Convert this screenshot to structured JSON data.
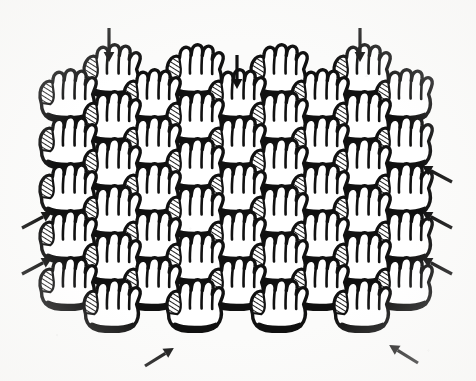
{
  "figure": {
    "title": "Tessellated hand pattern with directional arrows",
    "description": "A field of repeating mitten-like hand (glove) outlines arranged in a staggered offset grid, surrounded by solid black arrows pointing inward toward the pattern.",
    "background_color": "#fbfbfa",
    "ink_color": "#111111",
    "canvas": {
      "width": 476,
      "height": 381
    }
  },
  "motif": {
    "name": "hand-glove-outline",
    "fingers": 4,
    "has_hatched_thumb_panel": true,
    "has_thick_cuff": true,
    "nominal_width": 62,
    "nominal_height": 60,
    "outline_stroke": 3.4,
    "cuff_stroke": 5.0
  },
  "grid": {
    "type": "staggered-offset",
    "column_spacing": 83.5,
    "row_spacing": 47,
    "stagger_offset_x": 42,
    "main_column_x": [
      68,
      152,
      237,
      320,
      404
    ],
    "offset_column_x": [
      112,
      195,
      279,
      362
    ],
    "main_row_y": [
      98,
      145,
      192,
      239,
      286
    ],
    "offset_row_y": [
      73,
      120,
      167,
      214,
      261,
      308
    ],
    "hand_count": 50
  },
  "hands": [
    {
      "id": "hand-r0-c0",
      "x": 112,
      "y": 73,
      "row": 0,
      "col": 0
    },
    {
      "id": "hand-r0-c1",
      "x": 195,
      "y": 73,
      "row": 0,
      "col": 1
    },
    {
      "id": "hand-r0-c2",
      "x": 279,
      "y": 73,
      "row": 0,
      "col": 2
    },
    {
      "id": "hand-r0-c3",
      "x": 362,
      "y": 73,
      "row": 0,
      "col": 3
    },
    {
      "id": "hand-r1-c0",
      "x": 68,
      "y": 98,
      "row": 1,
      "col": 0
    },
    {
      "id": "hand-r1-c1",
      "x": 152,
      "y": 98,
      "row": 1,
      "col": 1
    },
    {
      "id": "hand-r1-c2",
      "x": 237,
      "y": 98,
      "row": 1,
      "col": 2
    },
    {
      "id": "hand-r1-c3",
      "x": 320,
      "y": 98,
      "row": 1,
      "col": 3
    },
    {
      "id": "hand-r1-c4",
      "x": 404,
      "y": 98,
      "row": 1,
      "col": 4
    },
    {
      "id": "hand-r2-c0",
      "x": 112,
      "y": 120,
      "row": 2,
      "col": 0
    },
    {
      "id": "hand-r2-c1",
      "x": 195,
      "y": 120,
      "row": 2,
      "col": 1
    },
    {
      "id": "hand-r2-c2",
      "x": 279,
      "y": 120,
      "row": 2,
      "col": 2
    },
    {
      "id": "hand-r2-c3",
      "x": 362,
      "y": 120,
      "row": 2,
      "col": 3
    },
    {
      "id": "hand-r3-c0",
      "x": 68,
      "y": 145,
      "row": 3,
      "col": 0
    },
    {
      "id": "hand-r3-c1",
      "x": 152,
      "y": 145,
      "row": 3,
      "col": 1
    },
    {
      "id": "hand-r3-c2",
      "x": 237,
      "y": 145,
      "row": 3,
      "col": 2
    },
    {
      "id": "hand-r3-c3",
      "x": 320,
      "y": 145,
      "row": 3,
      "col": 3
    },
    {
      "id": "hand-r3-c4",
      "x": 404,
      "y": 145,
      "row": 3,
      "col": 4
    },
    {
      "id": "hand-r4-c0",
      "x": 112,
      "y": 167,
      "row": 4,
      "col": 0
    },
    {
      "id": "hand-r4-c1",
      "x": 195,
      "y": 167,
      "row": 4,
      "col": 1
    },
    {
      "id": "hand-r4-c2",
      "x": 279,
      "y": 167,
      "row": 4,
      "col": 2
    },
    {
      "id": "hand-r4-c3",
      "x": 362,
      "y": 167,
      "row": 4,
      "col": 3
    },
    {
      "id": "hand-r5-c0",
      "x": 68,
      "y": 192,
      "row": 5,
      "col": 0
    },
    {
      "id": "hand-r5-c1",
      "x": 152,
      "y": 192,
      "row": 5,
      "col": 1
    },
    {
      "id": "hand-r5-c2",
      "x": 237,
      "y": 192,
      "row": 5,
      "col": 2
    },
    {
      "id": "hand-r5-c3",
      "x": 320,
      "y": 192,
      "row": 5,
      "col": 3
    },
    {
      "id": "hand-r5-c4",
      "x": 404,
      "y": 192,
      "row": 5,
      "col": 4
    },
    {
      "id": "hand-r6-c0",
      "x": 112,
      "y": 214,
      "row": 6,
      "col": 0
    },
    {
      "id": "hand-r6-c1",
      "x": 195,
      "y": 214,
      "row": 6,
      "col": 1
    },
    {
      "id": "hand-r6-c2",
      "x": 279,
      "y": 214,
      "row": 6,
      "col": 2
    },
    {
      "id": "hand-r6-c3",
      "x": 362,
      "y": 214,
      "row": 6,
      "col": 3
    },
    {
      "id": "hand-r7-c0",
      "x": 68,
      "y": 239,
      "row": 7,
      "col": 0
    },
    {
      "id": "hand-r7-c1",
      "x": 152,
      "y": 239,
      "row": 7,
      "col": 1
    },
    {
      "id": "hand-r7-c2",
      "x": 237,
      "y": 239,
      "row": 7,
      "col": 2
    },
    {
      "id": "hand-r7-c3",
      "x": 320,
      "y": 239,
      "row": 7,
      "col": 3
    },
    {
      "id": "hand-r7-c4",
      "x": 404,
      "y": 239,
      "row": 7,
      "col": 4
    },
    {
      "id": "hand-r8-c0",
      "x": 112,
      "y": 261,
      "row": 8,
      "col": 0
    },
    {
      "id": "hand-r8-c1",
      "x": 195,
      "y": 261,
      "row": 8,
      "col": 1
    },
    {
      "id": "hand-r8-c2",
      "x": 279,
      "y": 261,
      "row": 8,
      "col": 2
    },
    {
      "id": "hand-r8-c3",
      "x": 362,
      "y": 261,
      "row": 8,
      "col": 3
    },
    {
      "id": "hand-r9-c0",
      "x": 68,
      "y": 286,
      "row": 9,
      "col": 0
    },
    {
      "id": "hand-r9-c1",
      "x": 152,
      "y": 286,
      "row": 9,
      "col": 1
    },
    {
      "id": "hand-r9-c2",
      "x": 237,
      "y": 286,
      "row": 9,
      "col": 2
    },
    {
      "id": "hand-r9-c3",
      "x": 320,
      "y": 286,
      "row": 9,
      "col": 3
    },
    {
      "id": "hand-r9-c4",
      "x": 404,
      "y": 286,
      "row": 9,
      "col": 4
    },
    {
      "id": "hand-r10-c0",
      "x": 112,
      "y": 308,
      "row": 10,
      "col": 0
    },
    {
      "id": "hand-r10-c1",
      "x": 195,
      "y": 308,
      "row": 10,
      "col": 1
    },
    {
      "id": "hand-r10-c2",
      "x": 279,
      "y": 308,
      "row": 10,
      "col": 2
    },
    {
      "id": "hand-r10-c3",
      "x": 362,
      "y": 308,
      "row": 10,
      "col": 3
    }
  ],
  "arrows": [
    {
      "id": "arrow-top-left",
      "direction": "down",
      "angle": 90,
      "x": 109,
      "y": 28,
      "length": 30,
      "position": "top"
    },
    {
      "id": "arrow-top-center",
      "direction": "down",
      "angle": 90,
      "x": 237,
      "y": 55,
      "length": 22,
      "position": "top"
    },
    {
      "id": "arrow-top-right",
      "direction": "down",
      "angle": 90,
      "x": 360,
      "y": 28,
      "length": 30,
      "position": "top"
    },
    {
      "id": "arrow-left-upper",
      "direction": "up-right",
      "angle": -28,
      "x": 22,
      "y": 228,
      "length": 30,
      "position": "left"
    },
    {
      "id": "arrow-left-lower",
      "direction": "up-right",
      "angle": -28,
      "x": 22,
      "y": 274,
      "length": 30,
      "position": "left"
    },
    {
      "id": "arrow-right-upper",
      "direction": "up-left",
      "angle": 208,
      "x": 452,
      "y": 182,
      "length": 30,
      "position": "right"
    },
    {
      "id": "arrow-right-middle",
      "direction": "up-left",
      "angle": 208,
      "x": 452,
      "y": 228,
      "length": 30,
      "position": "right"
    },
    {
      "id": "arrow-right-lower",
      "direction": "up-left",
      "angle": 208,
      "x": 452,
      "y": 274,
      "length": 30,
      "position": "right"
    },
    {
      "id": "arrow-bottom-left",
      "direction": "up-right",
      "angle": -32,
      "x": 145,
      "y": 366,
      "length": 30,
      "position": "bottom"
    },
    {
      "id": "arrow-bottom-right",
      "direction": "up-left",
      "angle": 212,
      "x": 418,
      "y": 363,
      "length": 30,
      "position": "bottom"
    }
  ],
  "legend": {
    "arrow_count": 10,
    "arrow_color": "#111111"
  }
}
